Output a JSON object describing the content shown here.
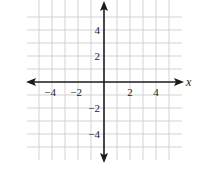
{
  "chart_data": {
    "type": "scatter",
    "title": "",
    "xlabel": "x",
    "ylabel": "",
    "xlim": [
      -6,
      6
    ],
    "ylim": [
      -6,
      6
    ],
    "grid": true,
    "grid_step": 1,
    "x_ticks": [
      {
        "value": -4,
        "label": "−4"
      },
      {
        "value": -2,
        "label": "−2"
      },
      {
        "value": 2,
        "label": "2"
      },
      {
        "value": 4,
        "label": "4"
      }
    ],
    "y_ticks": [
      {
        "value": 4,
        "label": "4"
      },
      {
        "value": 2,
        "label": "2"
      },
      {
        "value": -2,
        "label": "−2"
      },
      {
        "value": -4,
        "label": "−4"
      }
    ],
    "series": [],
    "colors": {
      "grid": "#c8c8c8",
      "axis": "#1a1a1a"
    }
  }
}
